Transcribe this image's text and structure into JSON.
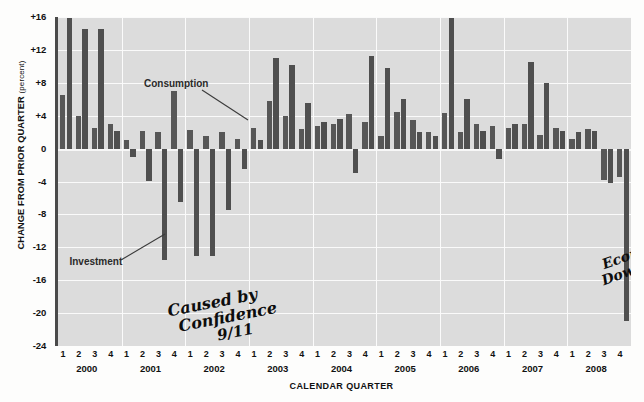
{
  "chart_data": {
    "type": "bar",
    "title": "",
    "subtitle": "",
    "xlabel": "CALENDAR QUARTER",
    "ylabel": "CHANGE FROM PRIOR QUARTER",
    "ylabel_unit": "(percent)",
    "ylim": [
      -24,
      16
    ],
    "yticks": [
      "+16",
      "+12",
      "+8",
      "+4",
      "0",
      "-4",
      "-8",
      "-12",
      "-16",
      "-20",
      "-24"
    ],
    "ytick_values": [
      16,
      12,
      8,
      4,
      0,
      -4,
      -8,
      -12,
      -16,
      -20,
      -24
    ],
    "grid": true,
    "legend_position": "in-plot-annotations",
    "categories": [
      "2000 Q1",
      "2000 Q2",
      "2000 Q3",
      "2000 Q4",
      "2001 Q1",
      "2001 Q2",
      "2001 Q3",
      "2001 Q4",
      "2002 Q1",
      "2002 Q2",
      "2002 Q3",
      "2002 Q4",
      "2003 Q1",
      "2003 Q2",
      "2003 Q3",
      "2003 Q4",
      "2004 Q1",
      "2004 Q2",
      "2004 Q3",
      "2004 Q4",
      "2005 Q1",
      "2005 Q2",
      "2005 Q3",
      "2005 Q4",
      "2006 Q1",
      "2006 Q2",
      "2006 Q3",
      "2006 Q4",
      "2007 Q1",
      "2007 Q2",
      "2007 Q3",
      "2007 Q4",
      "2008 Q1",
      "2008 Q2",
      "2008 Q3",
      "2008 Q4"
    ],
    "quarter_labels": [
      "1",
      "2",
      "3",
      "4",
      "1",
      "2",
      "3",
      "4",
      "1",
      "2",
      "3",
      "4",
      "1",
      "2",
      "3",
      "4",
      "1",
      "2",
      "3",
      "4",
      "1",
      "2",
      "3",
      "4",
      "1",
      "2",
      "3",
      "4",
      "1",
      "2",
      "3",
      "4",
      "1",
      "2",
      "3",
      "4"
    ],
    "year_labels": [
      "2000",
      "2001",
      "2002",
      "2003",
      "2004",
      "2005",
      "2006",
      "2007",
      "2008"
    ],
    "series": [
      {
        "name": "Consumption",
        "color": "#575757",
        "values": [
          6.5,
          4.0,
          2.5,
          3.0,
          1.0,
          2.2,
          2.0,
          7.0,
          2.3,
          1.5,
          2.0,
          1.2,
          2.5,
          5.8,
          4.0,
          2.4,
          2.8,
          3.0,
          4.2,
          3.2,
          1.5,
          4.5,
          3.5,
          2.0,
          4.3,
          2.0,
          3.0,
          2.8,
          2.5,
          3.0,
          1.6,
          2.5,
          1.2,
          2.4,
          -3.8,
          -3.5
        ]
      },
      {
        "name": "Investment",
        "color": "#4f4f4f",
        "values": [
          15.9,
          14.5,
          14.6,
          2.2,
          -1.0,
          -4.0,
          -13.5,
          -6.5,
          -13.0,
          -13.0,
          -7.5,
          -2.5,
          1.0,
          11.0,
          10.2,
          5.5,
          3.2,
          3.6,
          -3.0,
          11.3,
          9.8,
          6.0,
          2.0,
          1.5,
          15.9,
          6.0,
          2.2,
          -1.3,
          3.0,
          10.5,
          8.0,
          2.2,
          2.0,
          2.2,
          -4.2,
          -21.0
        ]
      }
    ],
    "annotations": [
      {
        "name": "consumption-label",
        "text": "Consumption",
        "x_pct": 15.0,
        "y_pct": 18.5
      },
      {
        "name": "investment-label",
        "text": "Investment",
        "x_pct": 2.0,
        "y_pct": 72.5
      },
      {
        "name": "handwritten-note-1",
        "line1": "Caused by",
        "line2": "Confidence",
        "line3": "9/11"
      },
      {
        "name": "handwritten-note-2",
        "line1": "Economy",
        "line2": "Downfall"
      }
    ]
  },
  "colors": {
    "plot_background": "#dcdcdc",
    "gridline": "#fafafa",
    "bar_consumption": "#575757",
    "bar_investment": "#4f4f4f",
    "axis": "#4a4a4a",
    "text": "#111111",
    "page_background": "#fdfdfc"
  }
}
